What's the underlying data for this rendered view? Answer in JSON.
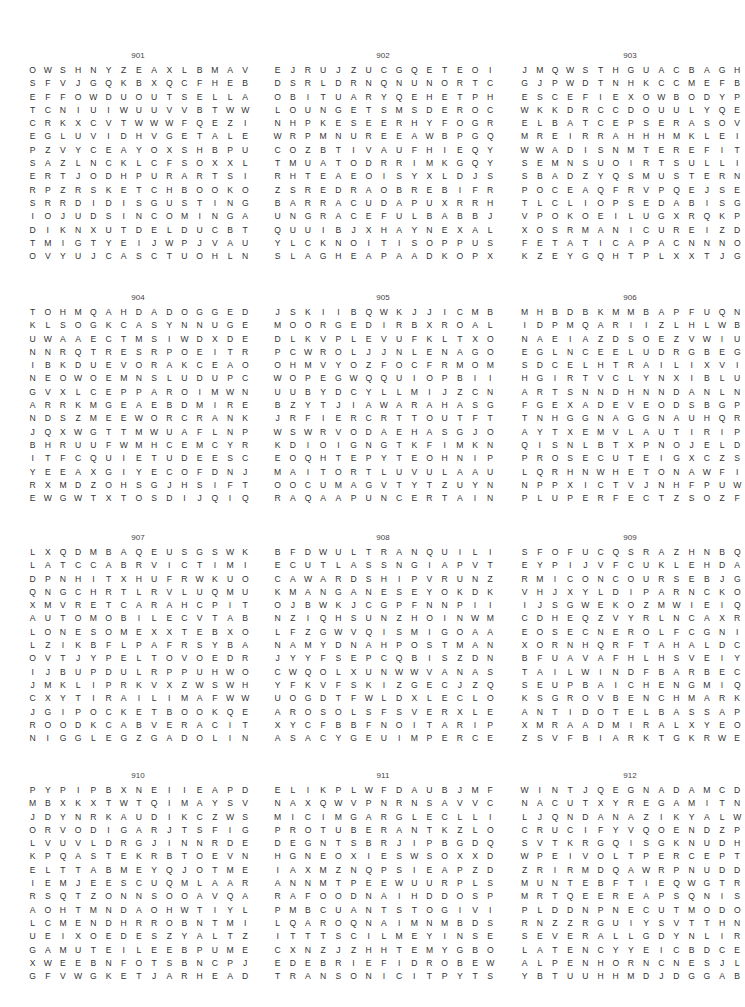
{
  "page": {
    "puzzles": [
      {
        "number": "901",
        "rows": [
          "OWSHNYZEAXLBMAVWDYN",
          "SFVJGQKBXQCFHEBRFOKL",
          "EFFOWDUOUTSELLATIEIA",
          "TCNIUIWUUVVBTWWVCULD",
          "CRKXCVTWWWFQEZIMOTAI",
          "EGLUVIDHVGETALERROCO",
          "PZVYCEAYOXSHBPUILLIL",
          "SAZLNCKLCFSOXXLLFROU",
          "ERTJODHPURARTSIGERTS",
          "RPZRSKETCHBOOKOWZEDS",
          "SRRDIDISGUSTINGGHFMO",
          "IOJUDSINCOMINGACNFAN",
          "DIKNXUTDELDUCBTMFOUG",
          "TMIGTYEIJWPJVAUVZEVE",
          "OVYUJCASCTUOHLNKBWEA"
        ]
      },
      {
        "number": "902",
        "rows": [
          "EJRUJZUCGQETEOIZVNJA",
          "DSRLDRNQNUNORTCOKDCR",
          "OBITUARYQEHETPHUNETC",
          "LOUNGETSMSDEROCCUSEH",
          "NHPKESEERHYFOGRYLWNI",
          "WRPMNUREEAWBPGQWGSAP",
          "COZBTIVAUFHIEQYFJVCE",
          "TMUATODRRIMKGQYHFXIL",
          "RHTEAEOISYXLDJSRBETA",
          "ZSREDRAOBREBIFRIBKYG",
          "BARRACUDAPUXRRHILUSO",
          "UNGRACEFULBABBJYVLOM",
          "QUUIBJXHAYNEXALFAEYI",
          "YLCKNOITISOPPUSQSERL",
          "SLAGHEAPAADKOPXOYGIA"
        ]
      },
      {
        "number": "903",
        "rows": [
          "JMQWSTHGUACBAGHSNSFP",
          "GJPWDTNHKCCMEFBAAICR",
          "ESCEFIEXOWBODYPNPNUO",
          "WKKDRCCDOUULYQECOGQT",
          "ELBATCEPSERASOVTLUIE",
          "MREIRRAHHHMKLEIIILPS",
          "WWADISNMTEREFITTHAFT",
          "SEMNSUOIRTSULLIYORSE",
          "SBADZYQSMUSTERNXTRGR",
          "POCEAQFRVPQEJSEVBNDZ",
          "TLCLIOPSEDABISGTELDE",
          "VPOKOEILUGXRQKPEDSYV",
          "XOSRMANICUREIZDVWEXE",
          "FETATICAPACNNNOPZNE",
          "KZEYGQHTPLXXTJGPSCMU"
        ]
      },
      {
        "number": "904",
        "rows": [
          "TOHMQAHDADOGGEDPTQII",
          "KLSOGKCASYNNUGECWTBV",
          "UWAAECTMSIWDXDELFITS",
          "NNRQTRESRPOEITRIEGZW",
          "IBKDUEVORAKCEAOYKXVK",
          "NEOWOEMNSLUDUPCBZQRU",
          "GVXLCEPPAROIMWNXQSFD",
          "ARRKMGEAEBDMIRETNINC",
          "NDSZMEEWORCRANKCASEH",
          "JQXWGTTMWUAFLNPWGWHA",
          "BHRUUFWMHCEMCYRNKPQM",
          "ITFCQUIETUDEESCRDESB",
          "YEEAXGIYECOFDNJUCFLR",
          "RXMDZOHSGJHSIFTAOGIA",
          "EWGWTXTOSDIJQIQEJYVY"
        ]
      },
      {
        "number": "905",
        "rows": [
          "JSKIIBQWKJJICMBYIDPN",
          "MOORGEDIRBXROALXBXMI",
          "DLKVPLEVUFKLTXOYYPCZ",
          "PCWROLJJNLENAGOETSIT",
          "OHMVYOZFOCFRMOMTEUME",
          "WOPEGWQQUIOPBIIYAOUN",
          "UUBYDCYLLMIJZCNWVNLU",
          "BZYTJIAWARAHASGMSOAR",
          "JRFIERCRTTOUTFTIURBE",
          "WSWRVODAEHASGJOUOHEF",
          "KDIOIGNGTKFIMKNANCTD",
          "EOQHTEPYTEOHNIPIENPC",
          "MAITORTLUVULAAURVYCY",
          "OOCUMAGVTYTZUYNMASMU",
          "RAQAAPUNCERTAINFRCXK"
        ]
      },
      {
        "number": "906",
        "rows": [
          "MHBDBKMMBAPFUQNZBHTC",
          "IDPMQARIIZLHLWBGRMOH",
          "NAEIAZDSOEZVWIUTTRBA",
          "EGLNCEELUDRGBEGNLYHR",
          "SDCELHTRAILIXVIHVSEN",
          "HGIRTVCLYNXIBLUGTAAE",
          "ARTSNNDHNNDANLNKHNTL",
          "FGEXADEVEODSBGPWSASB",
          "TNHGGNAGGNAUHQRYCTTE",
          "AYTXEMVLAUTIRIPSOORN",
          "QISNLBTXPNOJELDAUROI",
          "PROSECUTEIGXCZSQPIKG",
          "LQRHNWHETONAWFIQLUEN",
          "NPPXICTVJNHFPUWEEMTS",
          "PLUPERFECTZSOZFGBFIL"
        ]
      },
      {
        "number": "907",
        "rows": [
          "LXQDMBAQEUSGSWKCXPTL",
          "LATCCABRVICTIMIZEBVA",
          "DPNHITXHUFRWKUOLLJER",
          "QNGCHRTLRVLUQMUAPTRG",
          "XMVRETCARAHCPITROENE",
          "AUTOMOBILECVTABGELIL",
          "LONESOMEXXTEBXOEPLEY",
          "LZIKBFLPAFRSYBASSTRC",
          "OVTJYPELTOVOEDRSNALJ",
          "IJBUPDULRPPUHWOEWLII",
          "JMKLIPRKVXZWSWHKOEMH",
          "CXYTIRAILIMAFWWTTATW",
          "JGIPOCKETBOOKQEPRMYB",
          "ROODKCABVERACITYLOAP",
          "NIGGLEGZGADOLINIUMNJ"
        ]
      },
      {
        "number": "908",
        "rows": [
          "BFDWULTRANQUILIZERDX",
          "ECUTLASSNGIAPVTUVGIT",
          "CAWARDSHIPVRUNZIYKSH",
          "KMANGANESEYOKDKKFCTU",
          "OJBWKJCGPFNNPIIZVOAN",
          "NZIQHSUNZHOINWMTFXSD",
          "LFZGWVQISMIGOAAJOOTE",
          "NAMYDNAHPOSTMANTLRER",
          "JYYFSEPCQBISZDNEURYI",
          "CWQOLXUNWWVANASITRAP",
          "YFKVFSKIZGECJZQTFOEX",
          "UOGDTFWLDXLECLOOSUOC",
          "AROSOLSFSVERXLERUQEH",
          "XYCFBBFNOITARIPSNIUB",
          "ASACYGEUIMPERCEPTIVE"
        ]
      },
      {
        "number": "909",
        "rows": [
          "SFOFUCQSRAZHNBQHLZPH",
          "EYPIJVFCUKLEHDAJLQLE",
          "RMICONCOURSEBJGPNRST",
          "VHJXYLDIPARNCKOHPRIV",
          "IJSGWEKOZMWIEIQNEASV",
          "CDHEQZVYRLNCAXRVRSAU",
          "EOSECNEROLFCGNIAWFJX",
          "XORNHQRFTAHALDCTVCNA",
          "BFUAVAFHLHSVEIYIRALA",
          "TAILWINDFBARBECUEBLX",
          "SEUPBAICHENGMIQBCOQN",
          "KSGROVBENCHMARKSNXKK",
          "ANTIDOTELBASSAPMISYA",
          "XMRAADMIRALXYEOSMZFQ",
          "ZSVFBIARKTGKRWEENBXB"
        ]
      },
      {
        "number": "910",
        "rows": [
          "PYPIPBXNEIIEAPDQMDYE",
          "MBXKXTWTQIMAYSVKYNZS",
          "JDYNRKAUDIKCZWSSOOXR",
          "ORVODIGARJTSFIGOPIEE",
          "LVUVLDRGJINNRDEMMTFV",
          "KPQASTEKRBTOEVNECABS",
          "ELTTABMEYQJOTMEMPZDN",
          "IEMJEESCUQMLAARBRIEA",
          "RSQTZONNSOOAVQAEERTR",
          "AOHTMNDAOHWTIYLRSALT",
          "LCMENDHRROBNTMISILIJ",
          "UEIXOEDESZYALTZHDOTW",
          "GAMUTEILEEBPUMEIEPSR",
          "XWEEBNFOTSBNCPJPNCKL",
          "GFVWGKETJARHEADITLIX"
        ]
      },
      {
        "number": "911",
        "rows": [
          "ELIKPLWFDAUBJMFKZYLA",
          "NAXQWVPNRNSAVVCTUWVH",
          "MICIMGARGLECLLIHPUTR",
          "PROTUBERANTKZLOWDIEC",
          "DEGNTSBRJIPBGDQQMNCA",
          "HGNEOXIESWSOXXDSOKIE",
          "IAXMZNQPSIEAPZDIAYRR",
          "ANNMTPEEWUURPLSEEJCP",
          "RAFOODNAIHDDOSPGUQUH",
          "PMBCUANTSTOGIVIAUFMI",
          "LQAROQNAIMNMBDSOWBVL",
          "ITTTSCILMEYINSERTIEL",
          "CXNZJZHHTEMYGBOOEONY",
          "EDEBRIEFIDROBEWCFLTB",
          "TRANSONICITPYTSTOTYZ"
        ]
      },
      {
        "number": "912",
        "rows": [
          "WINTJQEGNADAMCDEFERT",
          "NACUTXYREGAMITNILREB",
          "LJQNDANAZIKYALWXYNZY",
          "CRUCIFYVQOENDZPODHAU",
          "SVTKRGQISGKNUDHMNFLA",
          "WPEIVOLTPERCEPTIONBH",
          "ZRIRMDQAWRPNUDDOKPGI",
          "MUNTEBFTIEQWGTRRORHN",
          "MRTQEEREAPSQNISPUCNA",
          "PLDDNPNECUTMODOVBUDFN",
          "RNZZRGUIYSVTTHNODRZI",
          "SEVERALLGDYNLIRNGRZM",
          "LATENCYYEICBDCECUAFA",
          "ALPENHORNCNESJLBDAST",
          "YBTUUHHMDJDGGABOLFTE"
        ]
      }
    ]
  }
}
